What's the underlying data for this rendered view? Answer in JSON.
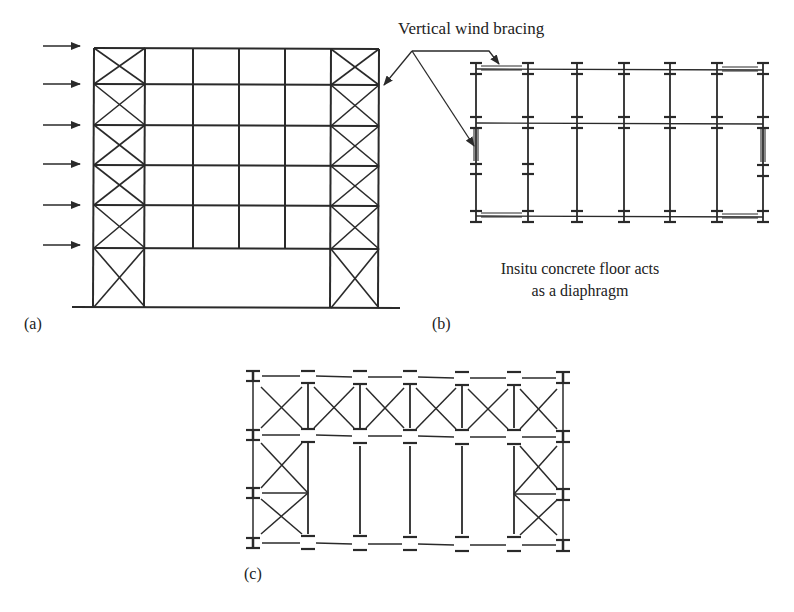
{
  "figure": {
    "annotations": {
      "bracing_callout": "Vertical wind bracing",
      "diaphragm_caption_line1": "Insitu concrete floor acts",
      "diaphragm_caption_line2": "as a diaphragm"
    },
    "panels": {
      "a": {
        "label": "(a)",
        "description": "Elevation of multi-storey frame with braced end bays and lateral wind loads"
      },
      "b": {
        "label": "(b)",
        "description": "Plan: vertical bracing in end bays, floor acts as diaphragm"
      },
      "c": {
        "label": "(c)",
        "description": "Plan: horizontal wind girder bracing in roof/floor plane"
      }
    },
    "colors": {
      "line": "#2a2a2a",
      "background": "#ffffff"
    },
    "elevation": {
      "wind_arrow_count": 6,
      "storeys_braced": 6,
      "bays": 6
    }
  }
}
